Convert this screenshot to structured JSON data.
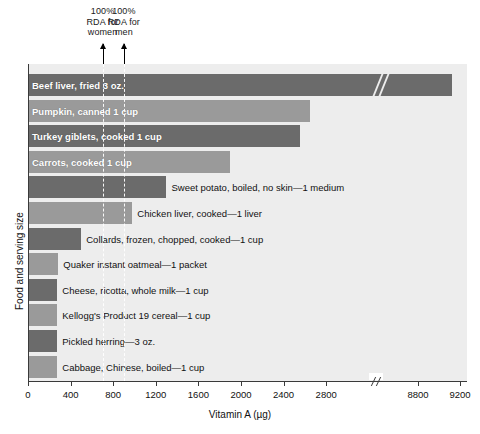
{
  "chart_data": {
    "type": "bar",
    "orientation": "horizontal",
    "title": "",
    "xlabel": "Vitamin A (µg)",
    "ylabel": "Food and serving size",
    "xlim": [
      0,
      9200
    ],
    "grid": false,
    "legend": "none",
    "axis_break": {
      "present": true,
      "after": 2800,
      "before": 8800
    },
    "xticks": [
      {
        "label": "0",
        "value": 0
      },
      {
        "label": "400",
        "value": 400
      },
      {
        "label": "800",
        "value": 800
      },
      {
        "label": "1200",
        "value": 1200
      },
      {
        "label": "1600",
        "value": 1600
      },
      {
        "label": "2000",
        "value": 2000
      },
      {
        "label": "2400",
        "value": 2400
      },
      {
        "label": "2800",
        "value": 2800
      },
      {
        "label": "8800",
        "value": 8800
      },
      {
        "label": "9200",
        "value": 9200
      }
    ],
    "categories": [
      "Beef liver, fried 3 oz.",
      "Pumpkin, canned 1 cup",
      "Turkey giblets, cooked 1 cup",
      "Carrots, cooked 1 cup",
      "Sweet potato, boiled, no skin—1 medium",
      "Chicken liver, cooked—1 liver",
      "Collards, frozen, chopped, cooked—1 cup",
      "Quaker instant oatmeal—1 packet",
      "Cheese, ricotta, whole milk—1 cup",
      "Kellogg's Product 19 cereal—1 cup",
      "Pickled herring—3 oz.",
      "Cabbage, Chinese, boiled—1 cup"
    ],
    "values": [
      9124,
      2650,
      2550,
      1900,
      1300,
      980,
      500,
      280,
      270,
      270,
      270,
      270
    ],
    "bars": [
      {
        "label": "Beef liver, fried 3 oz.",
        "value": 9124,
        "label_inside": true,
        "color": "#6b6b6b"
      },
      {
        "label": "Pumpkin, canned 1 cup",
        "value": 2650,
        "label_inside": true,
        "color": "#9a9a9a"
      },
      {
        "label": "Turkey giblets, cooked 1 cup",
        "value": 2550,
        "label_inside": true,
        "color": "#6b6b6b"
      },
      {
        "label": "Carrots, cooked 1 cup",
        "value": 1900,
        "label_inside": true,
        "color": "#9a9a9a"
      },
      {
        "label": "Sweet potato, boiled, no skin—1 medium",
        "value": 1300,
        "label_inside": false,
        "color": "#6b6b6b"
      },
      {
        "label": "Chicken liver, cooked—1 liver",
        "value": 980,
        "label_inside": false,
        "color": "#9a9a9a"
      },
      {
        "label": "Collards, frozen, chopped, cooked—1 cup",
        "value": 500,
        "label_inside": false,
        "color": "#6b6b6b"
      },
      {
        "label": "Quaker instant oatmeal—1 packet",
        "value": 285,
        "label_inside": false,
        "color": "#9a9a9a"
      },
      {
        "label": "Cheese, ricotta, whole milk—1 cup",
        "value": 275,
        "label_inside": false,
        "color": "#6b6b6b"
      },
      {
        "label": "Kellogg's Product 19 cereal—1 cup",
        "value": 275,
        "label_inside": false,
        "color": "#9a9a9a"
      },
      {
        "label": "Pickled herring—3 oz.",
        "value": 275,
        "label_inside": false,
        "color": "#6b6b6b"
      },
      {
        "label": "Cabbage, Chinese, boiled—1 cup",
        "value": 275,
        "label_inside": false,
        "color": "#9a9a9a"
      }
    ],
    "reference_lines": [
      {
        "id": "rda-women",
        "note": "100%\nRDA for\nwomen",
        "value": 700
      },
      {
        "id": "rda-men",
        "note": "100%\nRDA for\nmen",
        "value": 900
      }
    ],
    "colors": {
      "bar_dark": "#6b6b6b",
      "bar_light": "#9a9a9a",
      "plot_background": "#ededed",
      "axis": "#3a3a3a",
      "text": "#111111",
      "inside_label": "#ffffff"
    }
  }
}
